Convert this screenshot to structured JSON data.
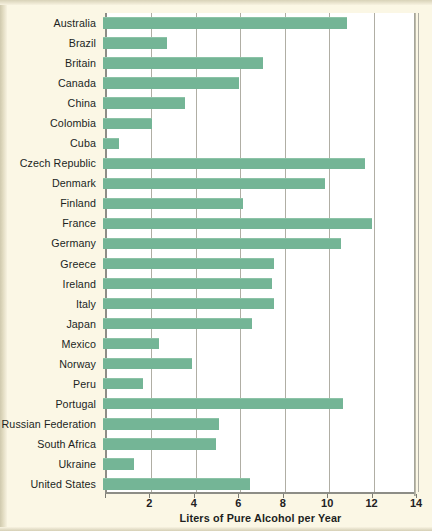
{
  "chart_data": {
    "type": "bar",
    "orientation": "horizontal",
    "title": "",
    "xlabel": "Liters of Pure Alcohol per Year",
    "ylabel": "",
    "xlim": [
      0,
      14
    ],
    "xticks": [
      0,
      2,
      4,
      6,
      8,
      10,
      12,
      14
    ],
    "xtick_labels": [
      "",
      "2",
      "4",
      "6",
      "8",
      "10",
      "12",
      "14"
    ],
    "grid": "vertical",
    "legend": "none",
    "bar_color": "#74b596",
    "plot_background": "#ffffff",
    "page_background": "#fbf7e5",
    "categories": [
      "Australia",
      "Brazil",
      "Britain",
      "Canada",
      "China",
      "Colombia",
      "Cuba",
      "Czech Republic",
      "Denmark",
      "Finland",
      "France",
      "Germany",
      "Greece",
      "Ireland",
      "Italy",
      "Japan",
      "Mexico",
      "Norway",
      "Peru",
      "Portugal",
      "Russian Federation",
      "South Africa",
      "Ukraine",
      "United States"
    ],
    "values": [
      11.0,
      2.9,
      7.2,
      6.1,
      3.7,
      2.2,
      0.7,
      11.8,
      10.0,
      6.3,
      12.1,
      10.7,
      7.7,
      7.6,
      7.7,
      6.7,
      2.5,
      4.0,
      1.8,
      10.8,
      5.2,
      5.1,
      1.4,
      6.6
    ]
  }
}
